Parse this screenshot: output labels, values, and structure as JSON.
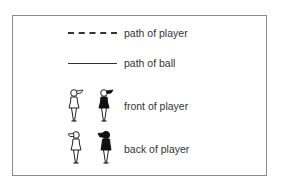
{
  "legend": {
    "items": [
      {
        "symbol": "dashed-line",
        "label": "path of player"
      },
      {
        "symbol": "solid-line",
        "label": "path of ball"
      },
      {
        "symbol": "player-figures-front",
        "label": "front of player"
      },
      {
        "symbol": "player-figures-back",
        "label": "back of player"
      }
    ]
  },
  "colors": {
    "line": "#333333",
    "figure_fill_dark": "#111111",
    "figure_fill_light": "#ffffff",
    "border": "#8a8a8a"
  }
}
